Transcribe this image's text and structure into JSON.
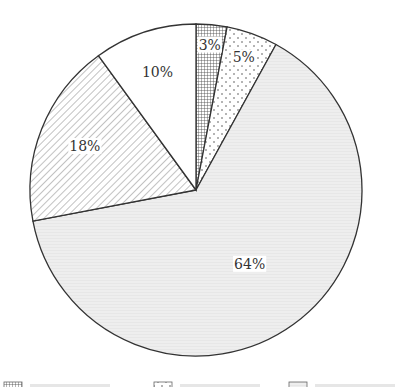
{
  "chart_data": {
    "type": "pie",
    "title": "",
    "start": "12 o'clock",
    "direction": "clockwise",
    "slices": [
      {
        "label": "3%",
        "value": 3,
        "pattern": "grid",
        "fill": "#ffffff"
      },
      {
        "label": "5%",
        "value": 5,
        "pattern": "dots",
        "fill": "#ffffff"
      },
      {
        "label": "64%",
        "value": 64,
        "pattern": "fine-horizontal",
        "fill": "#eeeeee"
      },
      {
        "label": "18%",
        "value": 18,
        "pattern": "diagonal-hatch",
        "fill": "#ffffff"
      },
      {
        "label": "10%",
        "value": 10,
        "pattern": "none",
        "fill": "#ffffff"
      }
    ],
    "legend": {
      "placement": "bottom",
      "entries_visible": 3,
      "note": "legend text is cropped at the bottom edge and unreadable"
    }
  },
  "colors": {
    "outline": "#333333",
    "pattern_stroke": "#555555",
    "label_text": "#333333"
  }
}
